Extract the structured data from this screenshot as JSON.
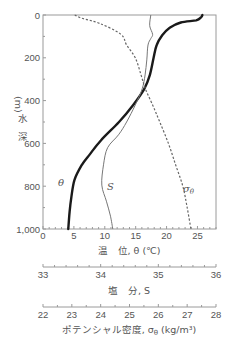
{
  "chart_data": {
    "type": "line",
    "title": "",
    "orientation": "vertical-profile (depth on y-axis, inverted)",
    "ylabel": "水 深 (m)",
    "ylim": [
      1000,
      0
    ],
    "yticks": [
      "0",
      "200",
      "400",
      "600",
      "800",
      "1,000"
    ],
    "x_axes": [
      {
        "id": "theta",
        "label": "温　位, θ (℃)",
        "range": [
          0,
          28
        ],
        "ticks": [
          "0",
          "5",
          "10",
          "15",
          "20",
          "25"
        ]
      },
      {
        "id": "salinity",
        "label": "塩　分, S",
        "range": [
          33,
          36
        ],
        "ticks": [
          "33",
          "34",
          "35",
          "36"
        ]
      },
      {
        "id": "density",
        "label": "ポテンシャル密度, σθ (kg/m³)",
        "range": [
          22,
          28
        ],
        "ticks": [
          "22",
          "23",
          "24",
          "25",
          "26",
          "27",
          "28"
        ]
      }
    ],
    "grid": false,
    "legend": "inline curve labels",
    "series": [
      {
        "name": "θ",
        "axis": "theta",
        "style": "thick solid",
        "depth": [
          0,
          10,
          25,
          35,
          60,
          95,
          140,
          200,
          280,
          345,
          420,
          500,
          585,
          650,
          700,
          770,
          850,
          920,
          1000
        ],
        "values": [
          25.8,
          25.6,
          24.8,
          22.3,
          20.5,
          19.3,
          18.4,
          17.9,
          17.3,
          16.4,
          14.6,
          12.3,
          9.4,
          7.6,
          6.3,
          5.1,
          4.6,
          4.3,
          4.1
        ]
      },
      {
        "name": "S",
        "axis": "salinity",
        "style": "thin solid",
        "depth": [
          0,
          50,
          90,
          110,
          140,
          210,
          280,
          345,
          420,
          500,
          560,
          620,
          700,
          795,
          870,
          940,
          1000
        ],
        "values": [
          34.87,
          34.85,
          34.9,
          34.87,
          34.82,
          34.8,
          34.77,
          34.72,
          34.6,
          34.45,
          34.31,
          34.12,
          34.05,
          34.02,
          34.1,
          34.17,
          34.21
        ]
      },
      {
        "name": "σθ",
        "axis": "density",
        "style": "dashed",
        "depth": [
          0,
          15,
          40,
          90,
          140,
          200,
          280,
          345,
          420,
          500,
          600,
          700,
          800,
          900,
          1000
        ],
        "values": [
          23.1,
          23.35,
          23.98,
          24.7,
          24.9,
          25.2,
          25.4,
          25.55,
          25.8,
          26.05,
          26.35,
          26.6,
          26.85,
          27.0,
          27.13
        ]
      }
    ],
    "annotations": [
      {
        "text": "θ",
        "near": "theta curve, ~780 m"
      },
      {
        "text": "S",
        "near": "salinity curve, ~780 m"
      },
      {
        "text": "σθ",
        "near": "density curve, ~780 m"
      }
    ]
  },
  "labels": {
    "ylabel_chars": [
      "水",
      "深",
      "(m)"
    ],
    "xlabel_theta": "温　位, θ (℃)",
    "xlabel_salinity": "塩　分, S",
    "xlabel_density_main": "ポテンシャル密度, σ",
    "xlabel_density_sub": "θ",
    "xlabel_density_unit": " (kg/m³)",
    "curve_theta": "θ",
    "curve_s": "S",
    "curve_sigma": "σ",
    "curve_sigma_sub": "θ"
  }
}
